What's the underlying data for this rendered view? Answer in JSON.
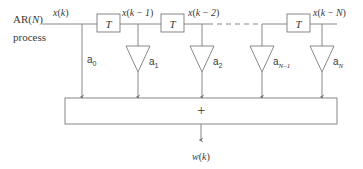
{
  "figure": {
    "type": "block-diagram",
    "stroke_color": "#7a7a7a",
    "text_color": "#3a3a3a",
    "background": "#ffffff"
  },
  "source": {
    "line1": "AR(N)",
    "line2": "process"
  },
  "signals": [
    {
      "name": "x(k)",
      "x": 53
    },
    {
      "name": "x(k-1)",
      "x": 122
    },
    {
      "name": "x(k-2)",
      "x": 188
    },
    {
      "name": "x(k-N)",
      "x": 313
    }
  ],
  "delays": [
    {
      "label": "T",
      "x": 97,
      "y": 14
    },
    {
      "label": "T",
      "x": 161,
      "y": 14
    },
    {
      "label": "T",
      "x": 287,
      "y": 14
    }
  ],
  "dashed_gap": {
    "from_x": 208,
    "to_x": 262,
    "y": 24
  },
  "taps": [
    {
      "label": "a",
      "sub": "0",
      "sub_style": "num",
      "x": 82,
      "triangle": false
    },
    {
      "label": "a",
      "sub": "1",
      "sub_style": "num",
      "x": 138,
      "triangle": true
    },
    {
      "label": "a",
      "sub": "2",
      "sub_style": "num",
      "x": 202,
      "triangle": true
    },
    {
      "label": "a",
      "sub": "N–1",
      "sub_style": "var",
      "x": 262,
      "triangle": true
    },
    {
      "label": "a",
      "sub": "N",
      "sub_style": "var",
      "x": 322,
      "triangle": true
    }
  ],
  "summer": {
    "symbol": "+",
    "x": 65,
    "y": 98,
    "width": 272,
    "height": 26
  },
  "output": {
    "label": "w(k)",
    "x": 202,
    "y": 152
  }
}
